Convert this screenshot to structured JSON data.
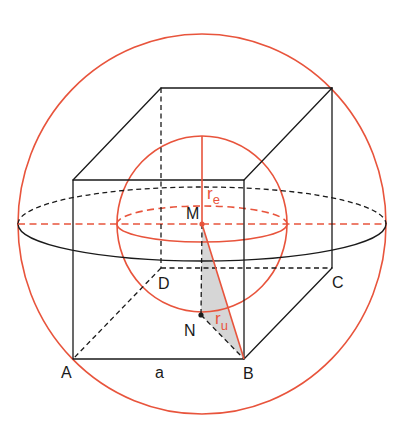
{
  "diagram": {
    "labels": {
      "A": "A",
      "B": "B",
      "C": "C",
      "D": "D",
      "M": "M",
      "N": "N",
      "edge": "a",
      "r_e": {
        "base": "r",
        "sub": "e"
      },
      "r_u": {
        "base": "r",
        "sub": "u"
      }
    },
    "colors": {
      "accent_red": "#e8543c",
      "line_black": "#1a1a1a",
      "triangle_fill": "#d6d6d6",
      "background": "#ffffff"
    },
    "elements": [
      "cube with edge a",
      "circumscribed sphere (radius r_u)",
      "inscribed sphere (radius r_e)",
      "equator of circumscribed sphere",
      "equator of inscribed sphere",
      "right triangle M-N-B (shaded)"
    ]
  }
}
